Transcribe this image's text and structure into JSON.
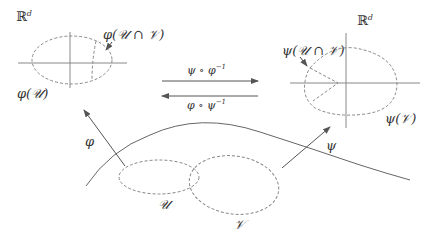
{
  "diagram": {
    "type": "manifold-charts",
    "colors": {
      "line": "#777777",
      "dashed": "#888888",
      "text": "#333333"
    },
    "left_space": {
      "label": "ℝ",
      "label_sup": "d",
      "set_label": "φ(𝒰)",
      "intersection_label": "φ(𝒰 ∩ 𝒱)"
    },
    "right_space": {
      "label": "ℝ",
      "label_sup": "d",
      "set_label": "ψ(𝒱)",
      "intersection_label": "ψ(𝒰 ∩ 𝒱)"
    },
    "transition_maps": {
      "forward": "ψ ∘ φ",
      "forward_sup": "−1",
      "backward": "φ ∘ ψ",
      "backward_sup": "−1"
    },
    "chart_maps": {
      "left": "φ",
      "right": "ψ"
    },
    "manifold_sets": {
      "u": "𝒰",
      "v": "𝒱"
    }
  }
}
